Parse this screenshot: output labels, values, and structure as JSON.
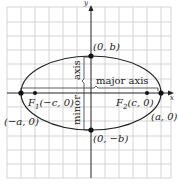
{
  "figure": {
    "type": "ellipse-diagram",
    "axes": {
      "x_label": "x",
      "y_label": "y"
    },
    "points": [
      {
        "name": "vertex-left",
        "label": "(−a, 0)"
      },
      {
        "name": "vertex-right",
        "label": "(a, 0)"
      },
      {
        "name": "co-vertex-top",
        "label": "(0, b)"
      },
      {
        "name": "co-vertex-bottom",
        "label": "(0, −b)"
      },
      {
        "name": "focus-1",
        "label": "F₁(−c, 0)",
        "prefix": "F",
        "sub": "1",
        "rest": "(−c, 0)"
      },
      {
        "name": "focus-2",
        "label": "F₂(c, 0)",
        "prefix": "F",
        "sub": "2",
        "rest": "(c, 0)"
      }
    ],
    "annotations": {
      "major_axis": "major axis",
      "minor_word": "minor",
      "axis_word": "axis"
    },
    "colors": {
      "grid": "#c9c9c9",
      "axis": "#222222",
      "curve": "#222222",
      "point": "#111111"
    }
  }
}
